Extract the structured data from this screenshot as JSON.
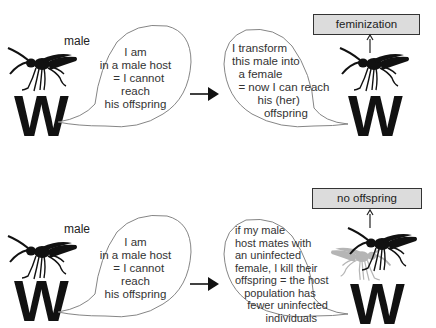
{
  "panels": [
    {
      "id": "top",
      "left": {
        "label": "male",
        "letter": "W",
        "bubble": "I am\nin a male host\n  = I cannot\nreach\nhis offspring"
      },
      "right": {
        "bubble": "I transform\nthis male into\n  a female\n  = now I can reach\n        his (her)\n          offspring",
        "letter": "W",
        "outcome_box": "feminization"
      }
    },
    {
      "id": "bottom",
      "left": {
        "label": "male",
        "letter": "W",
        "bubble": "I am\nin a male host\n  = I cannot\nreach\nhis offspring"
      },
      "right": {
        "bubble": "if my male\nhost mates with\nan uninfected\nfemale, I kill their\noffspring = the host\n   population has\n    fewer uninfected\n          individuals",
        "letter": "W",
        "outcome_box": "no offspring"
      }
    }
  ],
  "colors": {
    "wasp": "#111111",
    "ghost_wasp": "#b5b5b5",
    "box_fill": "#dcdcdc",
    "box_border": "#333333"
  }
}
